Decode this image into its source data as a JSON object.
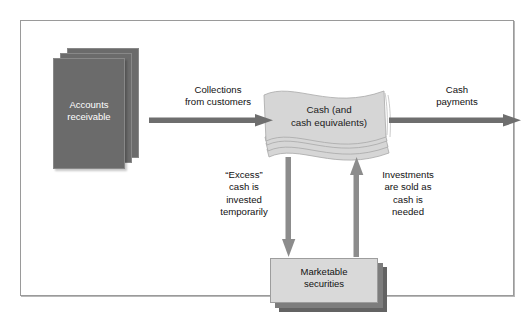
{
  "diagram": {
    "nodes": {
      "accounts_receivable": {
        "label": "Accounts\nreceivable",
        "style": "stacked-dark-box"
      },
      "cash": {
        "label": "Cash (and\ncash equivalents)",
        "style": "wavy-banknote-stack"
      },
      "marketable_securities": {
        "label": "Marketable\nsecurities",
        "style": "stacked-light-box"
      }
    },
    "arrows": [
      {
        "name": "collections",
        "label": "Collections\nfrom customers",
        "from": "accounts_receivable",
        "to": "cash",
        "direction": "right"
      },
      {
        "name": "cash-payments",
        "label": "Cash\npayments",
        "from": "cash",
        "to": "outflow",
        "direction": "right"
      },
      {
        "name": "excess-cash",
        "label": "“Excess”\ncash is\ninvested\ntemporarily",
        "from": "cash",
        "to": "marketable_securities",
        "direction": "down"
      },
      {
        "name": "investments-sold",
        "label": "Investments\nare sold as\ncash is\nneeded",
        "from": "marketable_securities",
        "to": "cash",
        "direction": "up"
      }
    ],
    "colors": {
      "dark_box": "#6b6b6b",
      "light_box": "#d9d9d9",
      "shadow_box": "#636363",
      "arrow": "#6e6e6e",
      "frame_border": "#9a9a9a",
      "background": "#ffffff",
      "dark_text": "#111111",
      "light_text": "#ffffff"
    }
  }
}
